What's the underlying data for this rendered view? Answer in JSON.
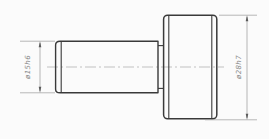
{
  "drawing": {
    "kind": "stepped-shaft-side-view",
    "dimensions": [
      {
        "label": "ø15h6",
        "part": "shaft",
        "symbol": "diameter"
      },
      {
        "label": "ø28h7",
        "part": "head",
        "symbol": "diameter"
      }
    ],
    "colors": {
      "background": "#fbfbfb",
      "object_line": "#3a3a3a",
      "dimension_line": "#9a9a9a",
      "arrow": "#5a5a5a",
      "text": "#8a8a8a"
    }
  }
}
